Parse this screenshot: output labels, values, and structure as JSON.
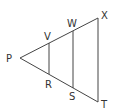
{
  "diagram": {
    "points": {
      "P": "P",
      "V": "V",
      "W": "W",
      "X": "X",
      "R": "R",
      "S": "S",
      "T": "T"
    },
    "stroke_color": "#333333"
  }
}
